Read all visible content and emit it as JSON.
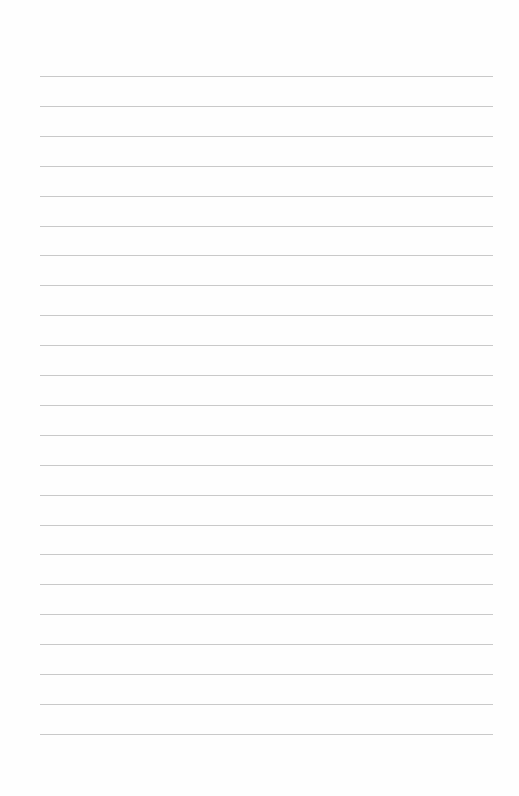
{
  "page": {
    "type": "lined-paper",
    "background_color": "#fefefe",
    "line_color": "#c9c9c9",
    "line_count": 23,
    "first_line_y": 76,
    "line_spacing": 29.9,
    "line_left": 40,
    "line_width": 453
  }
}
